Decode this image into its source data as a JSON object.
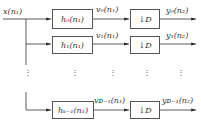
{
  "diagram": {
    "type": "polyphase filter bank with downsampling",
    "input": {
      "label": "x(n₁)"
    },
    "branches": [
      {
        "filter": "h₀(n₁)",
        "intermediate": "v₀(n₁)",
        "downsampler": "↓D",
        "output": "y₀(n₂)"
      },
      {
        "filter": "h₁(n₁)",
        "intermediate": "v₁(n₁)",
        "downsampler": "↓D",
        "output": "y₁(n₂)"
      },
      {
        "filter": "hₖ₋₁(n₁)",
        "intermediate": "vₓ₋₁(n₁)",
        "downsampler": "↓D",
        "output": "yₓ₋₁(n₂)"
      }
    ],
    "ellipsis": "⋮",
    "colors": {
      "line": "#333333",
      "box_border": "#555555",
      "background": "#ffffff"
    }
  },
  "labels": {
    "input": "x(n₁)",
    "h0": "h₀(n₁)",
    "h1": "h₁(n₁)",
    "hK": "hₖ₋₁(n₁)",
    "v0": "v₀(n₁)",
    "v1": "v₁(n₁)",
    "vD": "vᴅ₋₁(n₁)",
    "down": "↓D",
    "y0": "y₀(n₂)",
    "y1": "y₁(n₂)",
    "yD": "yᴅ₋₁(n₂)"
  }
}
